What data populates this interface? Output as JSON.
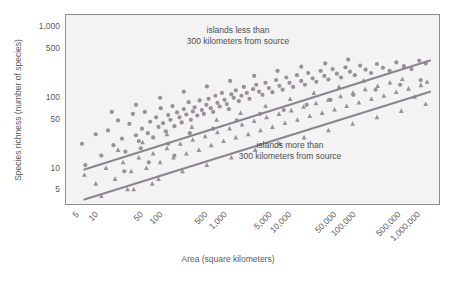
{
  "chart_data": {
    "type": "scatter",
    "title": "",
    "xlabel": "Area (square kilometers)",
    "ylabel": "Species richness (number of species)",
    "xscale": "log",
    "yscale": "log",
    "grid": false,
    "legend_position": "inside-annotations",
    "xlim": [
      3,
      2000000
    ],
    "ylim": [
      3,
      1500
    ],
    "xticks": [
      "5",
      "10",
      "50",
      "100",
      "500",
      "1,000",
      "5,000",
      "10,000",
      "50,000",
      "100,000",
      "500,000",
      "1,000,000"
    ],
    "xtick_values": [
      5,
      10,
      50,
      100,
      500,
      1000,
      5000,
      10000,
      50000,
      100000,
      500000,
      1000000
    ],
    "yticks": [
      "1,000",
      "500",
      "100",
      "50",
      "10",
      "5"
    ],
    "ytick_values": [
      1000,
      500,
      100,
      50,
      10,
      5
    ],
    "annotations": [
      {
        "name": "near-islands-label",
        "lines": [
          "islands less than",
          "300 kilometers from source"
        ],
        "x_px": 238,
        "y_px": 33
      },
      {
        "name": "far-islands-label",
        "lines": [
          "islands more than",
          "300 kilometers from source"
        ],
        "x_px": 290,
        "y_px": 148
      }
    ],
    "series": [
      {
        "name": "islands less than 300 kilometers from source",
        "marker": "circle",
        "color": "#9a8f9a",
        "trendline": {
          "x0": 6,
          "y0": 9.5,
          "x1": 1400000,
          "y1": 330
        },
        "points": [
          [
            5.5,
            22
          ],
          [
            6.2,
            11
          ],
          [
            9,
            30
          ],
          [
            11,
            15
          ],
          [
            14,
            34
          ],
          [
            17,
            21
          ],
          [
            20,
            47
          ],
          [
            23,
            26
          ],
          [
            26,
            17
          ],
          [
            30,
            42
          ],
          [
            34,
            58
          ],
          [
            38,
            29
          ],
          [
            42,
            24
          ],
          [
            47,
            36
          ],
          [
            52,
            62
          ],
          [
            58,
            31
          ],
          [
            63,
            45
          ],
          [
            70,
            27
          ],
          [
            78,
            52
          ],
          [
            85,
            38
          ],
          [
            92,
            70
          ],
          [
            100,
            43
          ],
          [
            110,
            33
          ],
          [
            120,
            56
          ],
          [
            130,
            48
          ],
          [
            140,
            75
          ],
          [
            150,
            39
          ],
          [
            165,
            61
          ],
          [
            180,
            52
          ],
          [
            195,
            44
          ],
          [
            210,
            68
          ],
          [
            230,
            57
          ],
          [
            250,
            85
          ],
          [
            270,
            48
          ],
          [
            290,
            63
          ],
          [
            310,
            72
          ],
          [
            340,
            55
          ],
          [
            370,
            90
          ],
          [
            400,
            66
          ],
          [
            430,
            58
          ],
          [
            470,
            78
          ],
          [
            510,
            95
          ],
          [
            550,
            70
          ],
          [
            600,
            62
          ],
          [
            650,
            105
          ],
          [
            700,
            83
          ],
          [
            760,
            74
          ],
          [
            820,
            115
          ],
          [
            900,
            92
          ],
          [
            980,
            80
          ],
          [
            1050,
            68
          ],
          [
            1150,
            110
          ],
          [
            1250,
            98
          ],
          [
            1350,
            125
          ],
          [
            1500,
            88
          ],
          [
            1650,
            105
          ],
          [
            1800,
            140
          ],
          [
            2000,
            115
          ],
          [
            2200,
            95
          ],
          [
            2500,
            130
          ],
          [
            2800,
            150
          ],
          [
            3100,
            120
          ],
          [
            3500,
            108
          ],
          [
            3900,
            160
          ],
          [
            4400,
            135
          ],
          [
            5000,
            118
          ],
          [
            5700,
            175
          ],
          [
            6400,
            145
          ],
          [
            7200,
            128
          ],
          [
            8200,
            190
          ],
          [
            9200,
            160
          ],
          [
            10500,
            140
          ],
          [
            12000,
            205
          ],
          [
            14000,
            170
          ],
          [
            16000,
            150
          ],
          [
            18000,
            220
          ],
          [
            21000,
            185
          ],
          [
            24000,
            165
          ],
          [
            28000,
            235
          ],
          [
            32000,
            200
          ],
          [
            37000,
            178
          ],
          [
            43000,
            250
          ],
          [
            50000,
            215
          ],
          [
            58000,
            190
          ],
          [
            68000,
            265
          ],
          [
            80000,
            230
          ],
          [
            95000,
            205
          ],
          [
            115000,
            280
          ],
          [
            140000,
            245
          ],
          [
            170000,
            220
          ],
          [
            210000,
            295
          ],
          [
            260000,
            260
          ],
          [
            330000,
            235
          ],
          [
            420000,
            310
          ],
          [
            550000,
            275
          ],
          [
            720000,
            250
          ],
          [
            950000,
            330
          ],
          [
            1200000,
            300
          ],
          [
            45,
            19
          ],
          [
            120,
            22
          ],
          [
            260,
            31
          ],
          [
            600,
            36
          ],
          [
            1400,
            47
          ],
          [
            3200,
            58
          ],
          [
            7500,
            66
          ],
          [
            17000,
            78
          ],
          [
            40000,
            92
          ],
          [
            90000,
            108
          ],
          [
            200000,
            128
          ],
          [
            480000,
            150
          ],
          [
            1000000,
            175
          ],
          [
            16,
            62
          ],
          [
            38,
            78
          ],
          [
            90,
            98
          ],
          [
            210,
            120
          ],
          [
            480,
            142
          ],
          [
            1100,
            170
          ],
          [
            2600,
            200
          ],
          [
            6000,
            235
          ],
          [
            14000,
            270
          ],
          [
            33000,
            300
          ],
          [
            75000,
            340
          ],
          [
            25,
            9
          ],
          [
            60,
            12
          ],
          [
            150,
            15
          ]
        ]
      },
      {
        "name": "islands more than 300 kilometers from source",
        "marker": "triangle",
        "color": "#9a8f9a",
        "trendline": {
          "x0": 6,
          "y0": 3.6,
          "x1": 1400000,
          "y1": 120
        },
        "points": [
          [
            6,
            8
          ],
          [
            9,
            6
          ],
          [
            13,
            10
          ],
          [
            18,
            7
          ],
          [
            24,
            12
          ],
          [
            32,
            9
          ],
          [
            42,
            14
          ],
          [
            55,
            10
          ],
          [
            70,
            16
          ],
          [
            90,
            12
          ],
          [
            115,
            19
          ],
          [
            145,
            14
          ],
          [
            185,
            22
          ],
          [
            230,
            16
          ],
          [
            290,
            25
          ],
          [
            360,
            18
          ],
          [
            450,
            28
          ],
          [
            560,
            21
          ],
          [
            700,
            32
          ],
          [
            870,
            24
          ],
          [
            1080,
            36
          ],
          [
            1350,
            27
          ],
          [
            1680,
            41
          ],
          [
            2100,
            30
          ],
          [
            2600,
            46
          ],
          [
            3250,
            34
          ],
          [
            4050,
            52
          ],
          [
            5000,
            38
          ],
          [
            6300,
            58
          ],
          [
            7800,
            43
          ],
          [
            9800,
            65
          ],
          [
            12200,
            48
          ],
          [
            15200,
            73
          ],
          [
            19000,
            54
          ],
          [
            23700,
            82
          ],
          [
            29500,
            60
          ],
          [
            36800,
            92
          ],
          [
            46000,
            67
          ],
          [
            57000,
            103
          ],
          [
            71000,
            75
          ],
          [
            89000,
            115
          ],
          [
            110000,
            84
          ],
          [
            138000,
            129
          ],
          [
            172000,
            94
          ],
          [
            215000,
            144
          ],
          [
            268000,
            105
          ],
          [
            334000,
            161
          ],
          [
            417000,
            118
          ],
          [
            520000,
            180
          ],
          [
            648000,
            132
          ],
          [
            808000,
            101
          ],
          [
            1010000,
            148
          ],
          [
            1260000,
            165
          ],
          [
            35,
            5
          ],
          [
            85,
            7
          ],
          [
            200,
            9
          ],
          [
            480,
            11
          ],
          [
            1150,
            14
          ],
          [
            2700,
            18
          ],
          [
            6500,
            22
          ],
          [
            15500,
            27
          ],
          [
            37000,
            34
          ],
          [
            88000,
            42
          ],
          [
            210000,
            52
          ],
          [
            500000,
            64
          ],
          [
            1200000,
            80
          ],
          [
            20,
            18
          ],
          [
            48,
            23
          ],
          [
            115,
            30
          ],
          [
            280,
            38
          ],
          [
            680,
            48
          ],
          [
            1600,
            60
          ],
          [
            3900,
            75
          ],
          [
            9400,
            94
          ],
          [
            22000,
            115
          ],
          [
            54000,
            140
          ],
          [
            130000,
            172
          ],
          [
            11,
            4
          ],
          [
            28,
            5
          ],
          [
            68,
            6
          ]
        ]
      }
    ]
  },
  "axes": {
    "plot_rect_px": {
      "x": 65,
      "y": 14,
      "w": 375,
      "h": 191
    }
  }
}
